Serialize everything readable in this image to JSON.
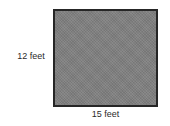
{
  "figure": {
    "type": "rectangle-dimension-diagram",
    "background_color": "#ffffff",
    "shape": {
      "name": "rectangle",
      "fill_color": "#808080",
      "border_color": "#262626"
    },
    "labels": {
      "height": "12 feet",
      "width": "15 feet"
    }
  },
  "chart_data": {
    "type": "table",
    "title": "",
    "categories": [
      "height",
      "width"
    ],
    "values": [
      12,
      15
    ],
    "units": "feet",
    "annotations": [
      "12 feet",
      "15 feet"
    ]
  }
}
